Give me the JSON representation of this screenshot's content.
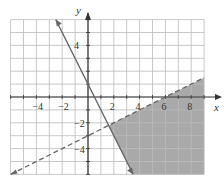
{
  "chart_data": {
    "type": "area",
    "title": "",
    "xlabel": "x",
    "ylabel": "y",
    "xlim": [
      -6,
      9
    ],
    "ylim": [
      -6,
      6
    ],
    "grid": true,
    "x_tick_labels": [
      "−4",
      "−2",
      "2",
      "4",
      "6",
      "8"
    ],
    "x_tick_values": [
      -4,
      -2,
      2,
      4,
      6,
      8
    ],
    "y_tick_labels": [
      "4",
      "−2",
      "−4"
    ],
    "y_tick_values": [
      4,
      -2,
      -4
    ],
    "series": [
      {
        "name": "solid boundary",
        "equation": "y = -2x + 1",
        "style": "solid",
        "points": [
          [
            -2.5,
            6
          ],
          [
            3.5,
            -6
          ]
        ]
      },
      {
        "name": "dashed boundary",
        "equation": "y = 0.5x - 3",
        "style": "dashed",
        "points": [
          [
            -6,
            -6
          ],
          [
            9,
            1.5
          ]
        ]
      }
    ],
    "shaded_region": "y < 0.5x - 3 and y >= -2x + 1",
    "colors": {
      "shade": "#9a9a9a",
      "line": "#666666",
      "grid": "#bbbbbb"
    }
  }
}
